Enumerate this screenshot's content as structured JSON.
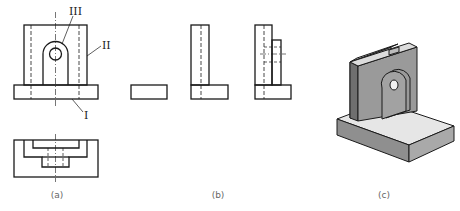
{
  "figure": {
    "panels": [
      {
        "id": "a",
        "caption": "(a)",
        "content": "Three-view orthographic drawing: front view and top view"
      },
      {
        "id": "b",
        "caption": "(b)",
        "content": "Decomposed component views: base block, upright plate (L), lug side view"
      },
      {
        "id": "c",
        "caption": "(c)",
        "content": "Isometric shaded view of bracket"
      }
    ],
    "part_labels": {
      "I": "I",
      "II": "II",
      "III": "III"
    },
    "colors": {
      "line": "#1a1a1a",
      "hidden_line": "#333333",
      "iso_top": "#dcdcdc",
      "iso_front": "#8f8f8f",
      "iso_side": "#a9a9a9",
      "iso_base_top": "#e6e6e6"
    }
  }
}
